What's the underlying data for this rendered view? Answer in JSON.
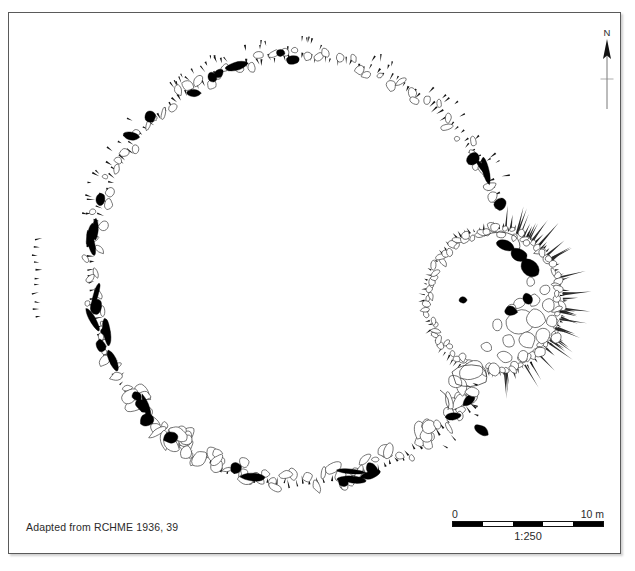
{
  "figure": {
    "kind": "archaeological-site-plan",
    "caption": "Adapted from RCHME 1936, 39",
    "frame": {
      "stroke": "#5a5a5a",
      "background": "#ffffff"
    }
  },
  "north_arrow": {
    "label": "N",
    "name": "north-arrow"
  },
  "scale_bar": {
    "min_label": "0",
    "max_label": "10 m",
    "ratio_label": "1:250",
    "segments": [
      "on",
      "off",
      "on",
      "off",
      "on"
    ],
    "units": "m",
    "length_m": 10
  },
  "symbols": {
    "filled_stone_color": "#000000",
    "outlined_stone_stroke": "#3b3b3b",
    "outlined_stone_fill": "#ffffff",
    "hachure_color": "#1a1a1a"
  },
  "chart_data": {
    "type": "map",
    "scale": "1:250",
    "features": [
      {
        "id": "outer-circle",
        "kind": "stone-circle",
        "centre": [
          300,
          270
        ],
        "radius_x": 210,
        "radius_y": 215
      },
      {
        "id": "inner-enclosure",
        "kind": "ring-cairn",
        "centre": [
          495,
          300
        ],
        "radius_x": 68,
        "radius_y": 72
      },
      {
        "id": "detached-hachures",
        "kind": "earthwork-scarp",
        "position": [
          38,
          280
        ]
      }
    ]
  }
}
